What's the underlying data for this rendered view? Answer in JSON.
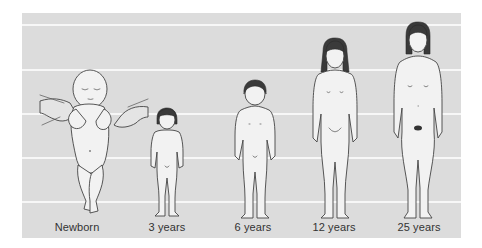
{
  "figure": {
    "background_color": "#dcdcdc",
    "gridline_color": "#f7f7f7",
    "stages": [
      {
        "id": "newborn",
        "label": "Newborn"
      },
      {
        "id": "age-3",
        "label": "3 years"
      },
      {
        "id": "age-6",
        "label": "6 years"
      },
      {
        "id": "age-12",
        "label": "12 years"
      },
      {
        "id": "age-25",
        "label": "25 years"
      }
    ]
  }
}
